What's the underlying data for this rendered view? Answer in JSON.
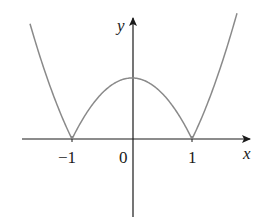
{
  "chart_data": {
    "type": "line",
    "title": "",
    "function": "y = |x^2 - 1|",
    "xlabel": "x",
    "ylabel": "y",
    "xlim": [
      -1.72,
      1.75
    ],
    "ylim": [
      -1.3,
      1.95
    ],
    "x_ticks": [
      -1,
      0,
      1
    ],
    "x_tick_labels": [
      "−1",
      "0",
      "1"
    ],
    "grid": false,
    "legend": null,
    "series": [
      {
        "name": "|x^2 - 1|",
        "x": [
          -1.7,
          -1.5,
          -1.25,
          -1.0,
          -0.75,
          -0.5,
          -0.25,
          0,
          0.25,
          0.5,
          0.75,
          1.0,
          1.25,
          1.5,
          1.75
        ],
        "values": [
          1.89,
          1.25,
          0.5625,
          0,
          0.4375,
          0.75,
          0.9375,
          1.0,
          0.9375,
          0.75,
          0.4375,
          0,
          0.5625,
          1.25,
          2.06
        ]
      }
    ],
    "curve_color": "#8a8a8a",
    "axis_color": "#1a1a1a"
  },
  "labels": {
    "x_axis": "x",
    "y_axis": "y",
    "tick_neg1": "−1",
    "tick_0": "0",
    "tick_1": "1"
  }
}
